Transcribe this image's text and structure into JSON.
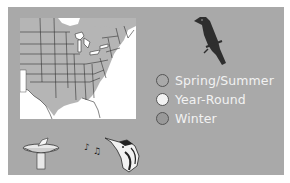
{
  "range_map": {
    "region": "Eastern United States range map",
    "colors": {
      "panel_background": "#a9a9a9",
      "map_background": "#ffffff",
      "range_fill": "#b5b5b5",
      "state_borders": "#333333"
    }
  },
  "bird_silhouette": {
    "icon": "perched-bird-silhouette",
    "color": "#2e2e2e"
  },
  "legend": {
    "items": [
      {
        "label": "Spring/Summer",
        "swatch_color": "#a9a9a9"
      },
      {
        "label": "Year-Round",
        "swatch_color": "#f2f2f2"
      },
      {
        "label": "Winter",
        "swatch_color": "#999999"
      }
    ]
  },
  "icons": {
    "bird_bath": "bird-bath-icon",
    "music_notes": "music-notes-icon",
    "bird_head": "bird-head-icon"
  }
}
